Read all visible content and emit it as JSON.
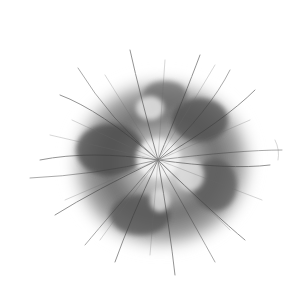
{
  "image": {
    "subject": "fluffy fur ball",
    "style": "grayscale",
    "background_color": "#ffffff",
    "tones": {
      "dark": "#3a3a3a",
      "mid": "#7a7a7a",
      "light": "#d8d8d8",
      "highlight": "#f4f4f4"
    },
    "center": {
      "x": 158,
      "y": 158
    },
    "radius": 95
  }
}
